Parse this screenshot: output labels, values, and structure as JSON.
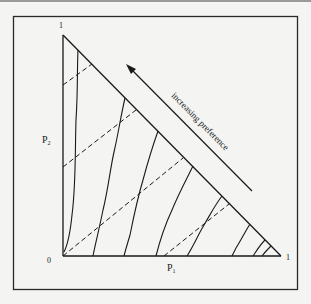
{
  "figure": {
    "axis_labels": {
      "x": "P",
      "x_sub": "1",
      "y": "P",
      "y_sub": "2"
    },
    "tick_labels": {
      "origin": "0",
      "x_max": "1",
      "y_max": "1"
    },
    "annotation": "increasing preference",
    "colors": {
      "background": "#f4f4f2",
      "ink": "#1a1a1a",
      "frame": "#2a2a2a"
    }
  }
}
